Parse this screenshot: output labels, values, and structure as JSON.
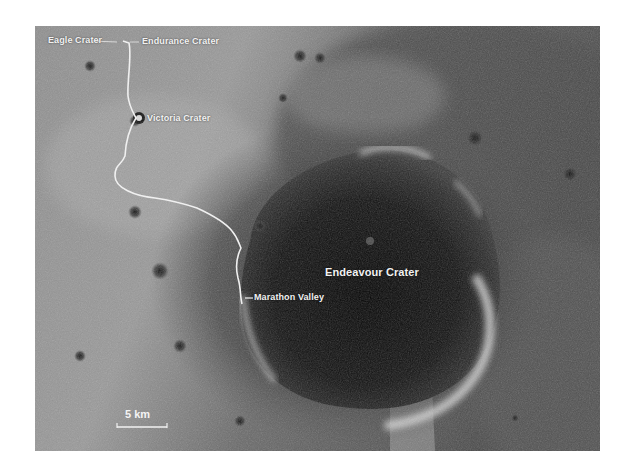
{
  "map": {
    "type": "satellite-mosaic",
    "colors": {
      "plains_light": "#9a9a9a",
      "plains_mid": "#7a7a7a",
      "dark_region": "#3a3a3a",
      "crater_floor": "#0e0e0e",
      "rim_highlight": "#d8d8d8",
      "traverse": "#f0f0f0",
      "label_text": "#f2f2f2"
    },
    "labels": {
      "eagle": "Eagle Crater",
      "endurance": "Endurance Crater",
      "victoria": "Victoria Crater",
      "endeavour": "Endeavour Crater",
      "marathon": "Marathon Valley"
    },
    "scale_bar": {
      "label": "5 km"
    }
  }
}
